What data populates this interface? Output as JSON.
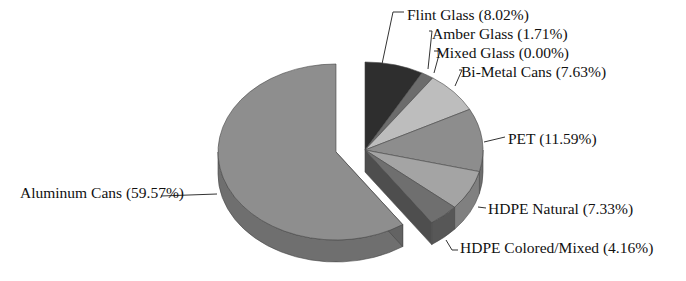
{
  "chart_data": {
    "type": "pie",
    "style": "3d-exploded",
    "title": "",
    "categories": [
      "Flint Glass",
      "Amber Glass",
      "Mixed Glass",
      "Bi-Metal Cans",
      "PET",
      "HDPE Natural",
      "HDPE Colored/Mixed",
      "Aluminum Cans"
    ],
    "values": [
      8.02,
      1.71,
      0.0,
      7.63,
      11.59,
      7.33,
      4.16,
      59.57
    ],
    "unit": "%",
    "labels": [
      "Flint Glass (8.02%)",
      "Amber Glass (1.71%)",
      "Mixed Glass (0.00%)",
      "Bi-Metal Cans (7.63%)",
      "PET (11.59%)",
      "HDPE Natural (7.33%)",
      "HDPE Colored/Mixed (4.16%)",
      "Aluminum Cans (59.57%)"
    ],
    "colors": [
      "#2e2e2e",
      "#6c6c6c",
      "#8a8a8a",
      "#bdbdbd",
      "#8d8d8d",
      "#a4a4a4",
      "#6f6f6f",
      "#8e8e8e"
    ],
    "exploded": [
      "Flint Glass",
      "Amber Glass",
      "Mixed Glass",
      "Bi-Metal Cans",
      "PET",
      "HDPE Natural",
      "HDPE Colored/Mixed"
    ],
    "legend": "none (leader-line labels)"
  }
}
